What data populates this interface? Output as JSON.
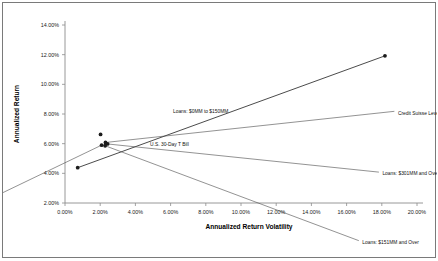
{
  "chart_data": {
    "type": "scatter",
    "title": "",
    "xlabel": "Annualized Return Volatility",
    "ylabel": "Annualized Return",
    "xlim": [
      0,
      20
    ],
    "ylim": [
      2,
      14
    ],
    "xticks": [
      "0.00%",
      "2.00%",
      "4.00%",
      "6.00%",
      "8.00%",
      "10.00%",
      "12.00%",
      "14.00%",
      "16.00%",
      "18.00%",
      "20.00%"
    ],
    "yticks": [
      "2.00%",
      "4.00%",
      "6.00%",
      "8.00%",
      "10.00%",
      "12.00%",
      "14.00%"
    ],
    "grid": false,
    "legend": "none",
    "units": "percent",
    "points": [
      {
        "label": "U.S. 30-Day T Bill",
        "x": 0.72,
        "y": 4.38,
        "label_dx": 4.0,
        "label_dy": 1.6,
        "leader": false
      },
      {
        "label": "Loans: $0MM to $150MM",
        "x": 2.02,
        "y": 6.62,
        "label_dx": 4.0,
        "label_dy": 1.6,
        "leader": false
      },
      {
        "label": "Credit Suisse Leveraged Loan Index",
        "x": 2.3,
        "y": 6.08,
        "label_dx": 16.5,
        "label_dy": 2.0,
        "leader": true
      },
      {
        "label": "Loans: $301MM and Over",
        "x": 2.42,
        "y": 5.98,
        "label_dx": 15.5,
        "label_dy": -2.0,
        "leader": true
      },
      {
        "label": "Loans: $151MM and Over",
        "x": 2.28,
        "y": 5.86,
        "label_dx": 14.5,
        "label_dy": -6.5,
        "leader": true
      },
      {
        "label": "Loans: $151MM to $300MM",
        "x": 2.08,
        "y": 5.9,
        "label_dx": -12.0,
        "label_dy": -7.0,
        "leader": true
      },
      {
        "label": "S&P 500",
        "x": 18.18,
        "y": 11.92,
        "label_dx": 4.5,
        "label_dy": 1.6,
        "leader": false
      }
    ],
    "trend_line": {
      "x0": 0.72,
      "y0": 4.38,
      "x1": 18.18,
      "y1": 11.92
    }
  }
}
